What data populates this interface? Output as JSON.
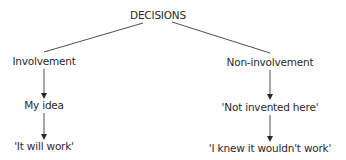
{
  "diagram": {
    "root": {
      "label": "DECISIONS"
    },
    "branches": [
      {
        "label": "Involvement",
        "steps": [
          "My idea",
          "'It will work'"
        ]
      },
      {
        "label": "Non-involvement",
        "steps": [
          "'Not invented here'",
          "'I knew it wouldn't work'"
        ]
      }
    ]
  },
  "colors": {
    "line": "#3a3a3a",
    "text": "#2a2a2a",
    "background": "#ffffff"
  }
}
